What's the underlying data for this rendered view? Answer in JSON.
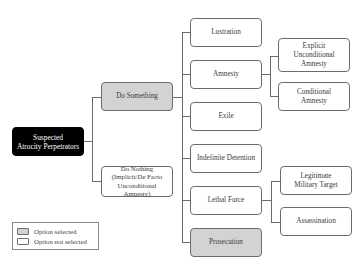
{
  "diagram": {
    "root": {
      "label_line1": "Suspected",
      "label_line2": "Atrocity Perpetrators",
      "selected": true
    },
    "level1": [
      {
        "label": "Do Something",
        "selected": true
      },
      {
        "label_line1": "Do Nothing",
        "label_line2": "(Implicit/De Facto",
        "label_line3": "Unconditional Amnesty)",
        "selected": false
      }
    ],
    "level2": [
      {
        "label": "Lustration",
        "selected": false
      },
      {
        "label": "Amnesty",
        "selected": false
      },
      {
        "label": "Exile",
        "selected": false
      },
      {
        "label": "Indefinite Detention",
        "selected": false
      },
      {
        "label": "Lethal Force",
        "selected": false
      },
      {
        "label": "Prosecution",
        "selected": true
      }
    ],
    "amnesty_children": [
      {
        "label_line1": "Explicit",
        "label_line2": "Unconditional",
        "label_line3": "Amnesty",
        "selected": false
      },
      {
        "label_line1": "Conditional",
        "label_line2": "Amnesty",
        "selected": false
      }
    ],
    "lethal_force_children": [
      {
        "label_line1": "Legitimate",
        "label_line2": "Military Target",
        "selected": false
      },
      {
        "label": "Assassination",
        "selected": false
      }
    ]
  },
  "legend": {
    "selected_label": "Option selected",
    "not_selected_label": "Option not selected"
  },
  "colors": {
    "selected_fill": "#d3d3d3",
    "unselected_fill": "#ffffff",
    "root_fill": "#000000",
    "border": "#6b6b6b"
  }
}
